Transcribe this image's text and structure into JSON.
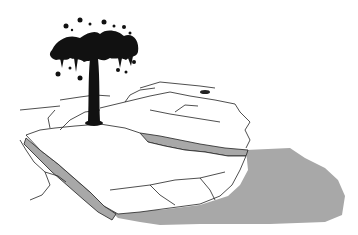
{
  "illustration": {
    "subject": "oil gusher erupting over a map of the Middle East",
    "style": "black and white pen-and-ink",
    "colors": {
      "background": "#ffffff",
      "ink": "#111111",
      "sea": "#a8a8a8",
      "sea_shadow": "#8c8c8c",
      "land": "#ffffff"
    }
  }
}
